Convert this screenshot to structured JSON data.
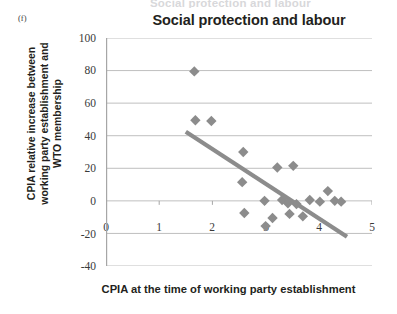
{
  "figure": {
    "panel_letter": "(f)",
    "cut_off_header": "Social protection and labour",
    "title": "Social protection and labour",
    "x_title": "CPIA at the time of working party establishment",
    "y_title_line1": "CPIA relative increase between",
    "y_title_line2": "working party establishment and",
    "y_title_line3": "WTO membership"
  },
  "colors": {
    "marker": "#8c8c8c",
    "trendline": "#8c8c8c",
    "gridline": "#bfbfbf",
    "axis": "#a6a6a6",
    "text": "#231f20"
  },
  "chart_data": {
    "type": "scatter",
    "title": "Social protection and labour",
    "xlabel": "CPIA at the time of working party establishment",
    "ylabel": "CPIA relative increase between working party establishment and WTO membership",
    "xlim": [
      0,
      5
    ],
    "ylim": [
      -40,
      100
    ],
    "xticks": [
      0,
      1,
      2,
      3,
      4,
      5
    ],
    "yticks": [
      -40,
      -20,
      0,
      20,
      40,
      60,
      80,
      100
    ],
    "grid": "horizontal",
    "legend": "none",
    "marker_shape": "diamond",
    "points": [
      {
        "x": 1.66,
        "y": 79.5
      },
      {
        "x": 1.68,
        "y": 49.5
      },
      {
        "x": 1.98,
        "y": 49.0
      },
      {
        "x": 2.58,
        "y": 30.0
      },
      {
        "x": 2.56,
        "y": 11.5
      },
      {
        "x": 2.6,
        "y": -7.5
      },
      {
        "x": 2.98,
        "y": 0.0
      },
      {
        "x": 3.0,
        "y": -15.5
      },
      {
        "x": 3.13,
        "y": -10.5
      },
      {
        "x": 3.22,
        "y": 20.5
      },
      {
        "x": 3.31,
        "y": 0.5
      },
      {
        "x": 3.42,
        "y": -1.5
      },
      {
        "x": 3.45,
        "y": -8.0
      },
      {
        "x": 3.52,
        "y": 21.5
      },
      {
        "x": 3.58,
        "y": -2.0
      },
      {
        "x": 3.7,
        "y": -9.5
      },
      {
        "x": 3.83,
        "y": 0.5
      },
      {
        "x": 4.02,
        "y": -0.5
      },
      {
        "x": 4.17,
        "y": 6.0
      },
      {
        "x": 4.3,
        "y": 0.0
      },
      {
        "x": 4.42,
        "y": -0.5
      }
    ],
    "trendline": {
      "x_start": 1.5,
      "y_start": 42.5,
      "x_end": 4.53,
      "y_end": -22.0
    }
  }
}
